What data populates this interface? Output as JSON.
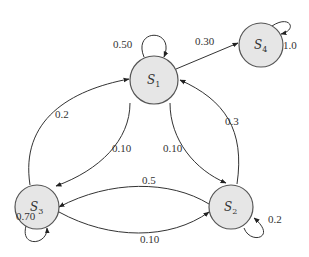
{
  "diagram": {
    "type": "state-transition-diagram",
    "nodes": [
      {
        "id": "S1",
        "label": "S",
        "sub": "1"
      },
      {
        "id": "S2",
        "label": "S",
        "sub": "2"
      },
      {
        "id": "S3",
        "label": "S",
        "sub": "3"
      },
      {
        "id": "S4",
        "label": "S",
        "sub": "4"
      }
    ],
    "edges": [
      {
        "from": "S1",
        "to": "S1",
        "label": "0.50"
      },
      {
        "from": "S1",
        "to": "S4",
        "label": "0.30"
      },
      {
        "from": "S4",
        "to": "S4",
        "label": "1.0"
      },
      {
        "from": "S3",
        "to": "S1",
        "label": "0.2"
      },
      {
        "from": "S1",
        "to": "S3",
        "label": "0.10"
      },
      {
        "from": "S1",
        "to": "S2",
        "label": "0.10"
      },
      {
        "from": "S2",
        "to": "S1",
        "label": "0.3"
      },
      {
        "from": "S2",
        "to": "S3",
        "label": "0.5"
      },
      {
        "from": "S3",
        "to": "S2",
        "label": "0.10"
      },
      {
        "from": "S3",
        "to": "S3",
        "label": "0.70"
      },
      {
        "from": "S2",
        "to": "S2",
        "label": "0.2"
      }
    ]
  }
}
